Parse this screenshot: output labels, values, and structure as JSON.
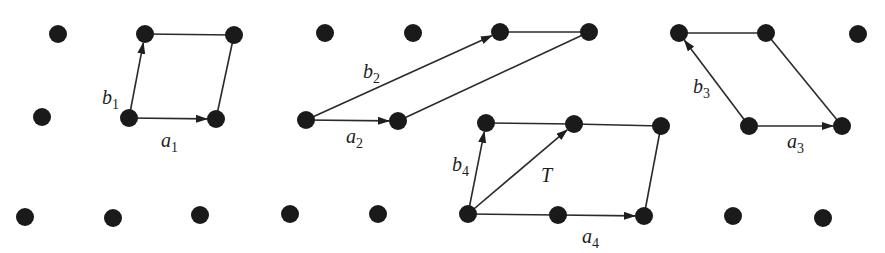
{
  "diagram": {
    "title": "",
    "colors": {
      "node": "#1a1a1a",
      "edge": "#2a2a2a",
      "background": "#ffffff"
    },
    "nodes": [
      {
        "id": "n1",
        "x": 58,
        "y": 34
      },
      {
        "id": "n2",
        "x": 145,
        "y": 34
      },
      {
        "id": "n3",
        "x": 234,
        "y": 35
      },
      {
        "id": "n4",
        "x": 325,
        "y": 33
      },
      {
        "id": "n5",
        "x": 413,
        "y": 33
      },
      {
        "id": "n6",
        "x": 500,
        "y": 32
      },
      {
        "id": "n7",
        "x": 589,
        "y": 32
      },
      {
        "id": "n8",
        "x": 679,
        "y": 33
      },
      {
        "id": "n9",
        "x": 766,
        "y": 33
      },
      {
        "id": "n10",
        "x": 858,
        "y": 34
      },
      {
        "id": "n11",
        "x": 42,
        "y": 117
      },
      {
        "id": "n12",
        "x": 129,
        "y": 118
      },
      {
        "id": "n13",
        "x": 216,
        "y": 119
      },
      {
        "id": "n14",
        "x": 306,
        "y": 120
      },
      {
        "id": "n15",
        "x": 398,
        "y": 121
      },
      {
        "id": "n16",
        "x": 486,
        "y": 123
      },
      {
        "id": "n17",
        "x": 574,
        "y": 124
      },
      {
        "id": "n18",
        "x": 661,
        "y": 126
      },
      {
        "id": "n19",
        "x": 749,
        "y": 126
      },
      {
        "id": "n20",
        "x": 842,
        "y": 126
      },
      {
        "id": "n21",
        "x": 25,
        "y": 217
      },
      {
        "id": "n22",
        "x": 113,
        "y": 218
      },
      {
        "id": "n23",
        "x": 200,
        "y": 215
      },
      {
        "id": "n24",
        "x": 290,
        "y": 214
      },
      {
        "id": "n25",
        "x": 378,
        "y": 214
      },
      {
        "id": "n26",
        "x": 468,
        "y": 214
      },
      {
        "id": "n27",
        "x": 558,
        "y": 215
      },
      {
        "id": "n28",
        "x": 644,
        "y": 216
      },
      {
        "id": "n29",
        "x": 733,
        "y": 216
      },
      {
        "id": "n30",
        "x": 823,
        "y": 218
      }
    ],
    "edges": [
      {
        "from": "n12",
        "to": "n13",
        "arrow": true
      },
      {
        "from": "n12",
        "to": "n2",
        "arrow": true
      },
      {
        "from": "n2",
        "to": "n3",
        "arrow": false
      },
      {
        "from": "n13",
        "to": "n3",
        "arrow": false
      },
      {
        "from": "n14",
        "to": "n15",
        "arrow": true
      },
      {
        "from": "n14",
        "to": "n6",
        "arrow": true
      },
      {
        "from": "n6",
        "to": "n7",
        "arrow": false
      },
      {
        "from": "n15",
        "to": "n7",
        "arrow": false
      },
      {
        "from": "n19",
        "to": "n20",
        "arrow": true
      },
      {
        "from": "n19",
        "to": "n8",
        "arrow": true
      },
      {
        "from": "n8",
        "to": "n9",
        "arrow": false
      },
      {
        "from": "n20",
        "to": "n9",
        "arrow": false
      },
      {
        "from": "n26",
        "to": "n27",
        "arrow": false
      },
      {
        "from": "n27",
        "to": "n28",
        "arrow": true
      },
      {
        "from": "n26",
        "to": "n16",
        "arrow": true
      },
      {
        "from": "n26",
        "to": "n17",
        "arrow": true
      },
      {
        "from": "n16",
        "to": "n17",
        "arrow": false
      },
      {
        "from": "n17",
        "to": "n18",
        "arrow": false
      },
      {
        "from": "n28",
        "to": "n18",
        "arrow": false
      }
    ],
    "labels": [
      {
        "id": "b1",
        "base": "b",
        "sub": "1",
        "x": 102,
        "y": 104
      },
      {
        "id": "a1",
        "base": "a",
        "sub": "1",
        "x": 161,
        "y": 147
      },
      {
        "id": "b2",
        "base": "b",
        "sub": "2",
        "x": 363,
        "y": 78
      },
      {
        "id": "a2",
        "base": "a",
        "sub": "2",
        "x": 346,
        "y": 143
      },
      {
        "id": "b3",
        "base": "b",
        "sub": "3",
        "x": 693,
        "y": 93
      },
      {
        "id": "a3",
        "base": "a",
        "sub": "3",
        "x": 787,
        "y": 148
      },
      {
        "id": "b4",
        "base": "b",
        "sub": "4",
        "x": 452,
        "y": 171
      },
      {
        "id": "T",
        "base": "T",
        "sub": "",
        "x": 541,
        "y": 182
      },
      {
        "id": "a4",
        "base": "a",
        "sub": "4",
        "x": 582,
        "y": 243
      }
    ]
  }
}
